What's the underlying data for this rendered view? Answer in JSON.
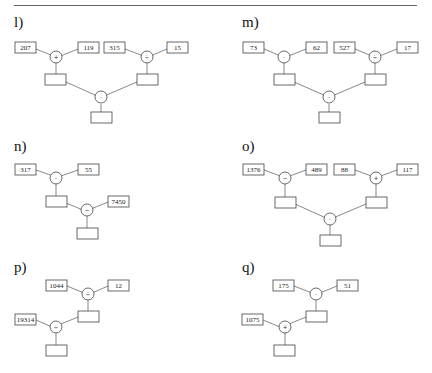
{
  "problems": {
    "l": {
      "label": "l)",
      "inputs": [
        "207",
        "119",
        "315",
        "15"
      ],
      "operators": [
        "+",
        "÷",
        "·"
      ]
    },
    "m": {
      "label": "m)",
      "inputs": [
        "73",
        "62",
        "527",
        "17"
      ],
      "operators": [
        "·",
        "÷",
        "·"
      ]
    },
    "n": {
      "label": "n)",
      "inputs": [
        "317",
        "55",
        "7450"
      ],
      "operators": [
        "·",
        "−"
      ]
    },
    "o": {
      "label": "o)",
      "inputs": [
        "1376",
        "489",
        "88",
        "117"
      ],
      "operators": [
        "−",
        "+",
        "·"
      ]
    },
    "p": {
      "label": "p)",
      "inputs": [
        "1044",
        "12",
        "19314"
      ],
      "operators": [
        "÷",
        "÷"
      ]
    },
    "q": {
      "label": "q)",
      "inputs": [
        "175",
        "51",
        "1075"
      ],
      "operators": [
        "·",
        "+"
      ]
    }
  },
  "answer_boxes": "empty"
}
